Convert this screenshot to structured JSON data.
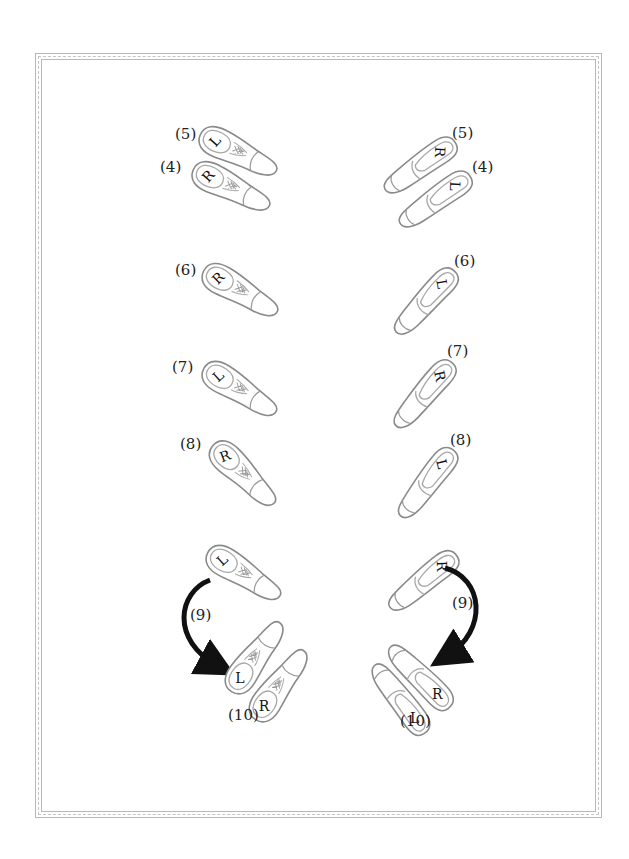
{
  "diagram": {
    "type": "dance-footwork-chart",
    "columns": [
      {
        "role": "man",
        "shoe_style": "oxford"
      },
      {
        "role": "lady",
        "shoe_style": "peep-toe pump"
      }
    ],
    "colors": {
      "outline": "#8a8a8a",
      "inner": "#b0b0b0",
      "text": "#222222",
      "arrow": "#111111",
      "frame": "#b8b8b8"
    }
  },
  "man": {
    "steps": [
      {
        "step": "(5)",
        "foot": "L"
      },
      {
        "step": "(4)",
        "foot": "R"
      },
      {
        "step": "(6)",
        "foot": "R"
      },
      {
        "step": "(7)",
        "foot": "L"
      },
      {
        "step": "(8)",
        "foot": "R"
      },
      {
        "step": "",
        "foot": "L"
      },
      {
        "step": "(9)",
        "foot": ""
      },
      {
        "step": "",
        "foot": "L"
      },
      {
        "step": "",
        "foot": "R"
      },
      {
        "step": "(10)",
        "foot": ""
      }
    ]
  },
  "lady": {
    "steps": [
      {
        "step": "(5)",
        "foot": "R"
      },
      {
        "step": "(4)",
        "foot": "L"
      },
      {
        "step": "(6)",
        "foot": "L"
      },
      {
        "step": "(7)",
        "foot": "R"
      },
      {
        "step": "(8)",
        "foot": "L"
      },
      {
        "step": "",
        "foot": "R"
      },
      {
        "step": "(9)",
        "foot": ""
      },
      {
        "step": "",
        "foot": "R"
      },
      {
        "step": "",
        "foot": "L"
      },
      {
        "step": "(10)",
        "foot": ""
      }
    ]
  }
}
